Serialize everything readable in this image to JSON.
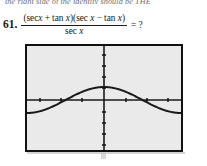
{
  "page": {
    "cutoff_header_text": "the right side of the identity should be THE",
    "background_color": "#ffffff"
  },
  "problem": {
    "number": "61.",
    "numerator_part1": "(sec",
    "numerator_var1": "x",
    "numerator_plus": "+",
    "numerator_part2": "tan",
    "numerator_var2": "x",
    "numerator_part3": ")(sec",
    "numerator_var3": "x",
    "numerator_minus": "−",
    "numerator_part4": "tan",
    "numerator_var4": "x",
    "numerator_part5": ")",
    "denominator_part": "sec",
    "denominator_var": "x",
    "equals_question": "= ?",
    "full_expression": "(sec x + tan x)(sec x − tan x) / sec x = ?",
    "answer_prompt": "?"
  },
  "calculator": {
    "screen_label": "graphing-calculator-screen",
    "frame_color": "#111111",
    "screen_color": "#eaeaea",
    "axis_color": "#1a1a1a",
    "curve_color": "#1a1a1a"
  },
  "chart_data": {
    "type": "line",
    "title": "",
    "xlabel": "",
    "ylabel": "",
    "grid": false,
    "legend": null,
    "xlim": [
      -3.14159,
      3.14159
    ],
    "ylim": [
      -2.0,
      2.0
    ],
    "x_axis_pixel_y": 100,
    "y_axis_pixel_x": 104,
    "x_tick_count": 6,
    "y_tick_count": 8,
    "series": [
      {
        "name": "y = cos x",
        "amplitude": 1.0,
        "period": 6.28319,
        "phase": 0.0,
        "x": [
          -3.1416,
          -2.8274,
          -2.5133,
          -2.1991,
          -1.885,
          -1.5708,
          -1.2566,
          -0.9425,
          -0.6283,
          -0.3142,
          0.0,
          0.3142,
          0.6283,
          0.9425,
          1.2566,
          1.5708,
          1.885,
          2.1991,
          2.5133,
          2.8274,
          3.1416
        ],
        "values": [
          -1.0,
          -0.951,
          -0.809,
          -0.588,
          -0.309,
          0.0,
          0.309,
          0.588,
          0.809,
          0.951,
          1.0,
          0.951,
          0.809,
          0.588,
          0.309,
          0.0,
          -0.309,
          -0.588,
          -0.809,
          -0.951,
          -1.0
        ]
      }
    ]
  }
}
